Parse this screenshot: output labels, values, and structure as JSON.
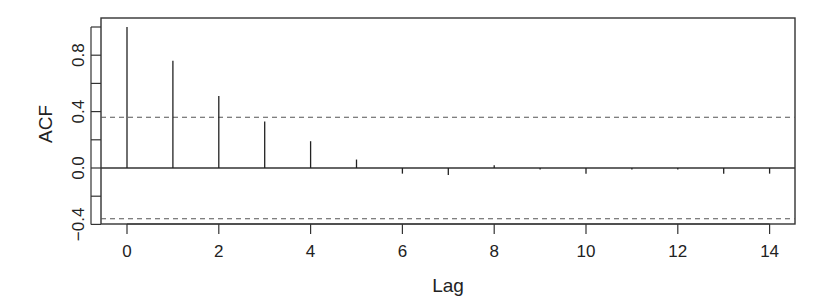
{
  "chart_data": {
    "type": "bar",
    "subtype": "acf-stem",
    "title": "",
    "xlabel": "Lag",
    "ylabel": "ACF",
    "x": [
      0,
      1,
      2,
      3,
      4,
      5,
      6,
      7,
      8,
      9,
      10,
      11,
      12,
      13,
      14
    ],
    "values": [
      1.0,
      0.76,
      0.51,
      0.33,
      0.19,
      0.06,
      -0.04,
      -0.05,
      0.02,
      -0.01,
      -0.04,
      -0.01,
      -0.01,
      -0.04,
      -0.04
    ],
    "confidence_bounds": [
      0.36,
      -0.36
    ],
    "xlim": [
      -0.6,
      14.6
    ],
    "ylim": [
      -0.42,
      1.03
    ],
    "xticks": [
      0,
      2,
      4,
      6,
      8,
      10,
      12,
      14
    ],
    "xtick_labels": [
      "0",
      "2",
      "4",
      "6",
      "8",
      "10",
      "12",
      "14"
    ],
    "yticks": [
      -0.4,
      -0.2,
      0.0,
      0.2,
      0.4,
      0.6,
      0.8,
      1.0
    ],
    "ytick_labels": [
      "-0.4",
      "0.0",
      "0.4",
      "0.8"
    ],
    "grid": false,
    "legend": null
  }
}
